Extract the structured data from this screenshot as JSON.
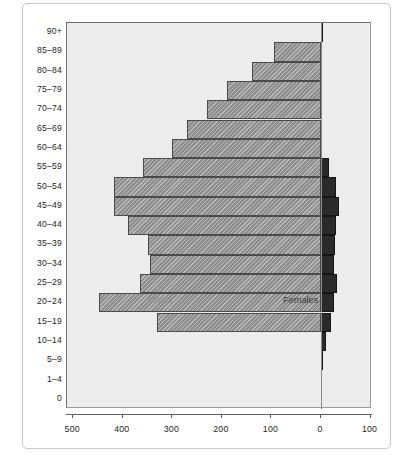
{
  "figure": {
    "title": "",
    "males_label": "Males",
    "females_label": "Females"
  },
  "chart_data": {
    "type": "bar",
    "subtype": "population-pyramid",
    "title": "",
    "subtitle": "",
    "xlabel": "",
    "ylabel": "",
    "orientation": "horizontal",
    "grid": false,
    "legend_position": "inside-plot",
    "xtick_labels": [
      "500",
      "400",
      "300",
      "200",
      "100",
      "0",
      "100"
    ],
    "xtick_values": [
      -500,
      -400,
      -300,
      -200,
      -100,
      0,
      100
    ],
    "xlim": [
      -515,
      100
    ],
    "categories": [
      "90+",
      "85–89",
      "80–84",
      "75–79",
      "70–74",
      "65–69",
      "60–64",
      "55–59",
      "50–54",
      "45–49",
      "40–44",
      "35–39",
      "30–34",
      "25–29",
      "20–24",
      "15–19",
      "10–14",
      "5–9",
      "1–4",
      "0"
    ],
    "series": [
      {
        "name": "Males",
        "color": "#8e8e8e",
        "hatch": "diagonal",
        "values": [
          0,
          95,
          140,
          190,
          230,
          270,
          300,
          360,
          418,
          418,
          390,
          350,
          345,
          365,
          448,
          330,
          0,
          0,
          0,
          0
        ]
      },
      {
        "name": "Females",
        "color": "#2b2b2b",
        "hatch": "solid",
        "values": [
          4,
          0,
          0,
          0,
          0,
          0,
          0,
          16,
          30,
          36,
          30,
          28,
          26,
          33,
          26,
          20,
          10,
          2,
          0,
          0
        ]
      }
    ]
  },
  "yaxis": {
    "ticks": [
      "90+",
      "85–89",
      "80–84",
      "75–79",
      "70–74",
      "65–69",
      "60–64",
      "55–59",
      "50–54",
      "45–49",
      "40–44",
      "35–39",
      "30–34",
      "25–29",
      "20–24",
      "15–19",
      "10–14",
      "5–9",
      "1–4",
      "0"
    ]
  },
  "colors": {
    "plot_background": "#ececec",
    "page_background": "#ffffff",
    "male_bar": "#8e8e8e",
    "female_bar": "#2b2b2b",
    "axis": "#5f5f5f",
    "frame": "#c9c9c9",
    "text": "#1d1d1d",
    "males_text": "#8f8f8f",
    "females_text": "#3c3c3c"
  }
}
